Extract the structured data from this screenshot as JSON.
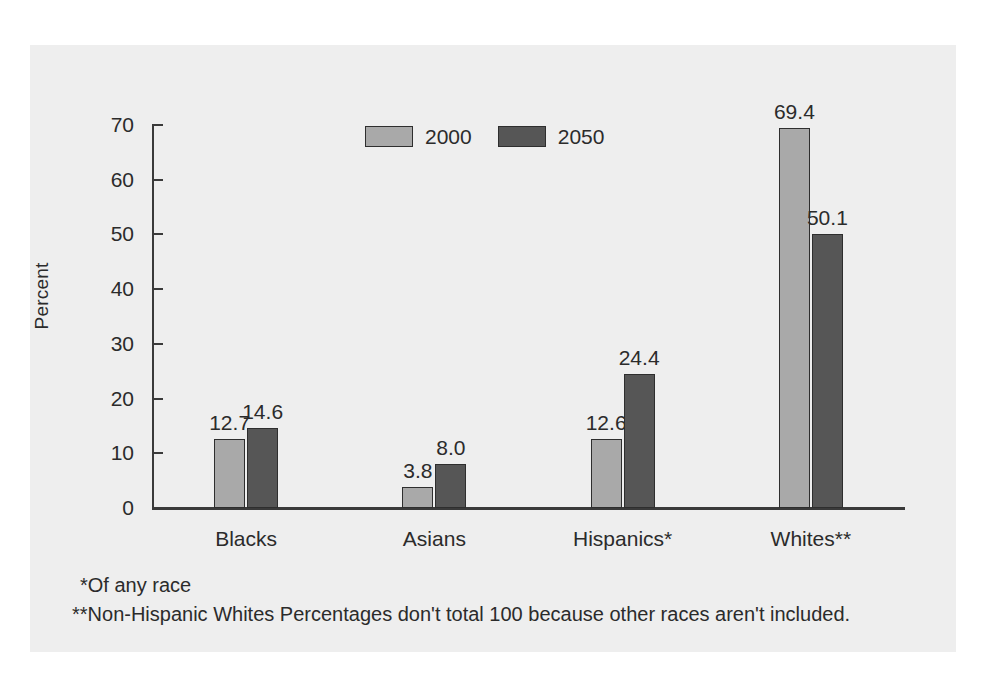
{
  "chart_data": {
    "type": "bar",
    "title": "",
    "subtitle": "",
    "xlabel": "",
    "ylabel": "Percent",
    "ylim": [
      0,
      70
    ],
    "ytick_labels": [
      "70",
      "60",
      "50",
      "40",
      "30",
      "20",
      "10",
      "0"
    ],
    "ytick_values": [
      70,
      60,
      50,
      40,
      30,
      20,
      10,
      0
    ],
    "grid": false,
    "legend_position": "top-center",
    "categories": [
      "Blacks",
      "Asians",
      "Hispanics*",
      "Whites**"
    ],
    "series": [
      {
        "name": "2000",
        "color": "#a9a9a9",
        "values": [
          12.7,
          3.8,
          12.6,
          69.4
        ],
        "labels": [
          "12.7",
          "3.8",
          "12.6",
          "69.4"
        ]
      },
      {
        "name": "2050",
        "color": "#565656",
        "values": [
          14.6,
          8.0,
          24.4,
          50.1
        ],
        "labels": [
          "14.6",
          "8.0",
          "24.4",
          "50.1"
        ]
      }
    ],
    "annotations": [
      "*Of any race",
      "**Non-Hispanic Whites Percentages don't total 100 because other races aren't included."
    ]
  },
  "figure": {
    "panel_color": "#eeeeee",
    "background_color": "#ffffff",
    "axis_color": "#3a3a3a",
    "text_color": "#2b2b2b"
  },
  "footnotes": {
    "line1": "*Of any race",
    "line2": "**Non-Hispanic Whites Percentages don't total 100 because other races aren't included."
  }
}
